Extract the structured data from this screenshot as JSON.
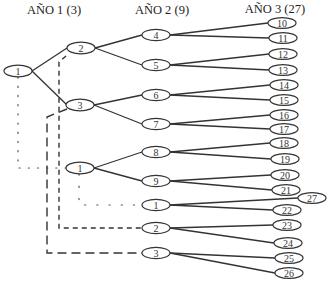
{
  "diagram": {
    "headers": {
      "year1": "AÑO 1 (3)",
      "year2": "AÑO 2 (9)",
      "year3": "AÑO 3 (27)"
    },
    "nodes": {
      "root": "1",
      "year1": [
        "2",
        "3",
        "1"
      ],
      "year2": [
        "4",
        "5",
        "6",
        "7",
        "8",
        "9",
        "1",
        "2",
        "3"
      ],
      "year3": [
        "10",
        "11",
        "12",
        "13",
        "14",
        "15",
        "16",
        "17",
        "18",
        "19",
        "20",
        "21",
        "27",
        "22",
        "23",
        "24",
        "25",
        "26"
      ]
    },
    "edges": [
      {
        "from": "root:1",
        "to": "year1:2",
        "style": "solid"
      },
      {
        "from": "root:1",
        "to": "year1:3",
        "style": "solid"
      },
      {
        "from": "root:1",
        "to": "year1:1",
        "style": "dotted"
      },
      {
        "from": "year1:2",
        "to": "year2:4",
        "style": "solid"
      },
      {
        "from": "year1:2",
        "to": "year2:5",
        "style": "solid"
      },
      {
        "from": "year1:2",
        "to": "year2:2",
        "style": "dashed"
      },
      {
        "from": "year1:3",
        "to": "year2:6",
        "style": "solid"
      },
      {
        "from": "year1:3",
        "to": "year2:7",
        "style": "solid"
      },
      {
        "from": "year1:3",
        "to": "year2:3",
        "style": "long-dashed"
      },
      {
        "from": "year1:1",
        "to": "year2:8",
        "style": "solid"
      },
      {
        "from": "year1:1",
        "to": "year2:9",
        "style": "solid"
      },
      {
        "from": "year1:1",
        "to": "year2:1",
        "style": "dotted"
      },
      {
        "from": "year2:4",
        "to": "year3:10",
        "style": "solid"
      },
      {
        "from": "year2:4",
        "to": "year3:11",
        "style": "solid"
      },
      {
        "from": "year2:5",
        "to": "year3:12",
        "style": "solid"
      },
      {
        "from": "year2:5",
        "to": "year3:13",
        "style": "solid"
      },
      {
        "from": "year2:6",
        "to": "year3:14",
        "style": "solid"
      },
      {
        "from": "year2:6",
        "to": "year3:15",
        "style": "solid"
      },
      {
        "from": "year2:7",
        "to": "year3:16",
        "style": "solid"
      },
      {
        "from": "year2:7",
        "to": "year3:17",
        "style": "solid"
      },
      {
        "from": "year2:8",
        "to": "year3:18",
        "style": "solid"
      },
      {
        "from": "year2:8",
        "to": "year3:19",
        "style": "solid"
      },
      {
        "from": "year2:9",
        "to": "year3:20",
        "style": "solid"
      },
      {
        "from": "year2:9",
        "to": "year3:21",
        "style": "solid"
      },
      {
        "from": "year2:1",
        "to": "year3:27",
        "style": "solid"
      },
      {
        "from": "year2:1",
        "to": "year3:22",
        "style": "solid"
      },
      {
        "from": "year2:2",
        "to": "year3:23",
        "style": "solid"
      },
      {
        "from": "year2:2",
        "to": "year3:24",
        "style": "solid"
      },
      {
        "from": "year2:3",
        "to": "year3:25",
        "style": "solid"
      },
      {
        "from": "year2:3",
        "to": "year3:26",
        "style": "solid"
      }
    ]
  },
  "colors": {
    "background": "#ffffff",
    "line": "#333333",
    "text": "#222222"
  }
}
